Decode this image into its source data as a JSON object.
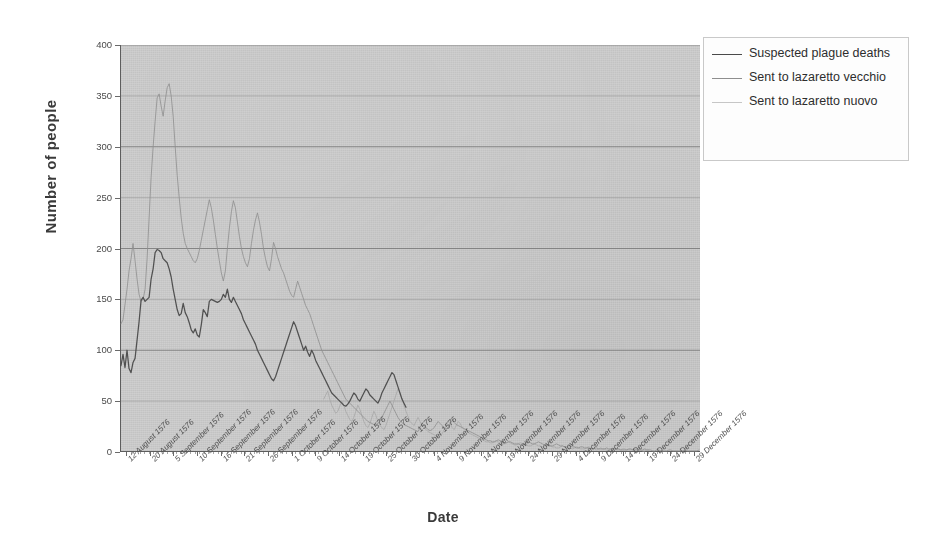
{
  "chart_data": {
    "type": "line",
    "title": "",
    "xlabel": "Date",
    "ylabel": "Number of people",
    "ylim": [
      0,
      400
    ],
    "yticks": [
      0,
      50,
      100,
      150,
      200,
      250,
      300,
      350,
      400
    ],
    "grid": true,
    "legend_position": "top-right",
    "xtick_labels": [
      "12 August 1576",
      "20 August 1576",
      "5 September 1576",
      "10 September 1576",
      "16 September 1576",
      "21 September 1576",
      "26 September 1576",
      "1 October 1576",
      "9 October 1576",
      "14 October 1576",
      "19 October 1576",
      "25 October 1576",
      "30 October 1576",
      "4 November 1576",
      "9 November 1576",
      "14 November 1576",
      "19 November 1576",
      "24 November 1576",
      "29 November 1576",
      "4 December 1576",
      "9 December 1576",
      "14 December 1576",
      "19 December 1576",
      "24 December 1576",
      "29 December 1576"
    ],
    "series": [
      {
        "name": "Suspected plague deaths",
        "color": "#4a4a4a",
        "values": [
          85,
          96,
          83,
          100,
          82,
          78,
          88,
          92,
          110,
          128,
          149,
          152,
          148,
          150,
          152,
          170,
          180,
          196,
          199,
          198,
          196,
          190,
          188,
          186,
          180,
          172,
          160,
          150,
          140,
          134,
          136,
          146,
          137,
          133,
          127,
          120,
          117,
          121,
          115,
          113,
          125,
          140,
          137,
          133,
          148,
          150,
          149,
          148,
          147,
          148,
          150,
          155,
          152,
          160,
          150,
          147,
          152,
          148,
          144,
          140,
          136,
          130,
          126,
          122,
          118,
          114,
          110,
          106,
          100,
          96,
          92,
          88,
          84,
          80,
          76,
          72,
          70,
          74,
          80,
          86,
          92,
          98,
          104,
          110,
          116,
          122,
          128,
          124,
          118,
          112,
          106,
          100,
          104,
          98,
          94,
          100,
          96,
          90,
          86,
          82,
          78,
          74,
          70,
          66,
          62,
          58,
          56,
          54,
          52,
          50,
          48,
          46,
          45,
          47,
          50,
          54,
          58,
          56,
          52,
          50,
          54,
          58,
          62,
          60,
          56,
          54,
          52,
          50,
          48,
          52,
          58,
          62,
          66,
          70,
          74,
          78,
          76,
          70,
          64,
          58,
          52,
          48,
          44,
          null,
          null,
          null,
          null,
          null,
          null,
          null,
          null,
          null,
          null,
          null,
          null,
          null,
          null,
          null,
          null,
          null,
          null,
          null,
          null,
          null,
          null,
          null,
          null,
          null,
          null,
          null,
          null,
          null,
          null,
          null,
          null,
          null,
          null,
          null,
          null,
          null,
          null,
          null,
          null,
          null,
          null,
          null,
          null,
          null,
          null,
          null,
          null,
          null,
          null,
          null,
          null,
          null,
          null,
          null,
          null,
          null,
          null,
          null,
          null,
          null,
          null,
          null,
          null,
          null,
          null,
          null,
          null,
          null,
          null,
          null,
          null,
          null,
          null,
          null,
          null,
          null,
          null,
          null,
          null,
          null,
          null,
          null,
          null,
          null,
          null,
          null,
          null,
          null,
          null,
          null,
          null,
          null,
          null,
          null,
          null,
          null,
          null,
          null,
          null,
          null
        ]
      },
      {
        "name": "Sent to lazaretto vecchio",
        "color": "#8e8e8e",
        "values": [
          126,
          130,
          145,
          160,
          178,
          190,
          205,
          188,
          170,
          155,
          148,
          150,
          160,
          190,
          230,
          270,
          300,
          325,
          348,
          352,
          340,
          330,
          345,
          358,
          362,
          350,
          330,
          300,
          272,
          250,
          230,
          215,
          205,
          200,
          196,
          192,
          188,
          186,
          190,
          198,
          208,
          218,
          228,
          238,
          248,
          240,
          228,
          214,
          200,
          188,
          176,
          168,
          178,
          200,
          220,
          236,
          247,
          240,
          226,
          212,
          200,
          192,
          186,
          182,
          190,
          205,
          218,
          228,
          235,
          226,
          214,
          200,
          190,
          182,
          178,
          190,
          206,
          200,
          192,
          186,
          180,
          176,
          170,
          164,
          158,
          154,
          152,
          160,
          168,
          162,
          156,
          150,
          144,
          140,
          136,
          130,
          124,
          118,
          112,
          106,
          100,
          96,
          92,
          88,
          84,
          80,
          76,
          72,
          68,
          64,
          60,
          56,
          52,
          50,
          48,
          46,
          44,
          42,
          40,
          38,
          36,
          34,
          32,
          30,
          29,
          28,
          27,
          27,
          28,
          30,
          34,
          38,
          42,
          46,
          50,
          46,
          42,
          38,
          34,
          31,
          29,
          27,
          26,
          25,
          24,
          23,
          22,
          21,
          20,
          24,
          28,
          26,
          24,
          22,
          21,
          22,
          24,
          27,
          30,
          28,
          26,
          24,
          23,
          24,
          28,
          31,
          29,
          27,
          26,
          25,
          24,
          23,
          22,
          21,
          20,
          19,
          18,
          17,
          16,
          15,
          14,
          13,
          12,
          11,
          11,
          10,
          10,
          11,
          12,
          11,
          10,
          9,
          9,
          10,
          10,
          9,
          8,
          8,
          8,
          7,
          7,
          8,
          9,
          10,
          9,
          8,
          8,
          9,
          10,
          9,
          8,
          7,
          7,
          6,
          6,
          6,
          7,
          8,
          7,
          6,
          6,
          5,
          5,
          6,
          6,
          5,
          5,
          4,
          4,
          5,
          5,
          4,
          4,
          4,
          3,
          3,
          4,
          4,
          3,
          3,
          3,
          3,
          4,
          3,
          3,
          2,
          2,
          3,
          3,
          2,
          2,
          2,
          2,
          3,
          3,
          2,
          2,
          2,
          2,
          2,
          2,
          3,
          2,
          2,
          2,
          1,
          1,
          2,
          2,
          1,
          1,
          1,
          1,
          2,
          2,
          1,
          1,
          1,
          1,
          1,
          1,
          2,
          1,
          1,
          1,
          1,
          1,
          1,
          2
        ]
      },
      {
        "name": "Sent to lazaretto nuovo",
        "color": "#a8a8a8",
        "values": [
          null,
          null,
          null,
          null,
          null,
          null,
          null,
          null,
          null,
          null,
          null,
          null,
          null,
          null,
          null,
          null,
          null,
          null,
          null,
          null,
          null,
          null,
          null,
          null,
          null,
          null,
          null,
          null,
          null,
          null,
          null,
          null,
          null,
          null,
          null,
          null,
          null,
          null,
          null,
          null,
          null,
          null,
          null,
          null,
          null,
          null,
          null,
          null,
          null,
          null,
          null,
          null,
          null,
          null,
          null,
          null,
          null,
          null,
          null,
          null,
          null,
          null,
          null,
          null,
          null,
          null,
          null,
          null,
          null,
          null,
          null,
          null,
          null,
          null,
          null,
          null,
          null,
          null,
          null,
          null,
          null,
          null,
          null,
          null,
          null,
          null,
          null,
          null,
          null,
          null,
          null,
          null,
          null,
          null,
          null,
          null,
          null,
          null,
          null,
          null,
          null,
          52,
          56,
          60,
          52,
          46,
          42,
          38,
          40,
          45,
          50,
          46,
          40,
          36,
          32,
          30,
          34,
          40,
          46,
          42,
          36,
          30,
          26,
          24,
          28,
          34,
          40,
          36,
          30,
          26,
          24,
          22,
          26,
          32,
          38,
          44,
          50,
          56,
          62,
          58,
          52,
          46,
          40,
          35,
          30,
          28,
          26,
          30,
          34,
          30,
          26,
          24,
          22,
          20,
          19,
          18,
          17,
          16,
          15,
          16,
          18,
          22,
          26,
          30,
          28,
          24,
          22,
          26,
          30,
          28,
          24,
          22,
          20,
          19,
          18,
          17,
          16,
          15,
          14,
          13,
          12,
          11,
          10,
          10,
          9,
          9,
          10,
          11,
          10,
          9,
          8,
          8,
          9,
          10,
          9,
          8,
          7,
          7,
          8,
          9,
          8,
          7,
          7,
          6,
          6,
          7,
          8,
          7,
          6,
          6,
          5,
          5,
          6,
          7,
          6,
          5,
          5,
          4,
          4,
          5,
          6,
          5,
          4,
          4,
          4,
          3,
          4,
          5,
          4,
          3,
          3,
          3,
          4,
          5,
          4,
          3,
          3,
          2,
          3,
          4,
          3,
          3,
          2,
          2,
          3,
          4,
          3,
          2,
          2,
          2,
          3,
          3,
          2,
          2,
          2,
          2,
          3,
          3,
          2,
          2,
          1,
          1,
          2,
          2
        ]
      }
    ]
  },
  "legend": {
    "items": [
      {
        "label": "Suspected plague deaths",
        "color": "#4a4a4a"
      },
      {
        "label": "Sent to lazaretto vecchio",
        "color": "#8e8e8e"
      },
      {
        "label": "Sent to lazaretto nuovo",
        "color": "#a8a8a8"
      }
    ]
  },
  "axes": {
    "y_title": "Number of people",
    "x_title": "Date"
  },
  "colors": {
    "plot_background": "#cfcfcf",
    "gridline": "#6f6f6f",
    "page_background": "#ffffff"
  }
}
